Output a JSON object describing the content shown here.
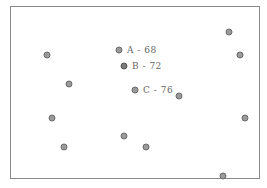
{
  "figure": {
    "frame": {
      "x": 10,
      "y": 6,
      "width": 250,
      "height": 173
    },
    "colors": {
      "dot_fill": "#9a9a9a",
      "dot_stroke": "#6a6a6a",
      "dot_dark_fill": "#7a7a7a",
      "label": "#666666",
      "border": "#8a8a8a"
    },
    "labeled_points": [
      {
        "id": "A",
        "text": "A - 68",
        "x": 119,
        "y": 50
      },
      {
        "id": "B",
        "text": "B - 72",
        "x": 124,
        "y": 66,
        "dark": true
      },
      {
        "id": "C",
        "text": "C - 76",
        "x": 135,
        "y": 90
      }
    ],
    "points": [
      {
        "x": 229,
        "y": 32
      },
      {
        "x": 47,
        "y": 55
      },
      {
        "x": 240,
        "y": 55
      },
      {
        "x": 69,
        "y": 84
      },
      {
        "x": 179,
        "y": 96
      },
      {
        "x": 52,
        "y": 118
      },
      {
        "x": 245,
        "y": 118
      },
      {
        "x": 124,
        "y": 136
      },
      {
        "x": 64,
        "y": 147
      },
      {
        "x": 146,
        "y": 147
      },
      {
        "x": 223,
        "y": 176
      }
    ]
  }
}
